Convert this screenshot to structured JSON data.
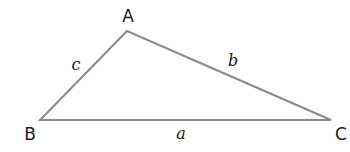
{
  "diagram": {
    "type": "triangle",
    "stroke_color": "#8a8a8a",
    "vertices": [
      {
        "label": "A",
        "x": 127,
        "y": 31,
        "label_x": 128,
        "label_y": 22
      },
      {
        "label": "B",
        "x": 40,
        "y": 120,
        "label_x": 30,
        "label_y": 140
      },
      {
        "label": "C",
        "x": 331,
        "y": 120,
        "label_x": 341,
        "label_y": 140
      }
    ],
    "sides": [
      {
        "label": "c",
        "between": [
          "A",
          "B"
        ],
        "label_x": 76,
        "label_y": 70
      },
      {
        "label": "b",
        "between": [
          "A",
          "C"
        ],
        "label_x": 233,
        "label_y": 66
      },
      {
        "label": "a",
        "between": [
          "B",
          "C"
        ],
        "label_x": 181,
        "label_y": 139
      }
    ]
  }
}
